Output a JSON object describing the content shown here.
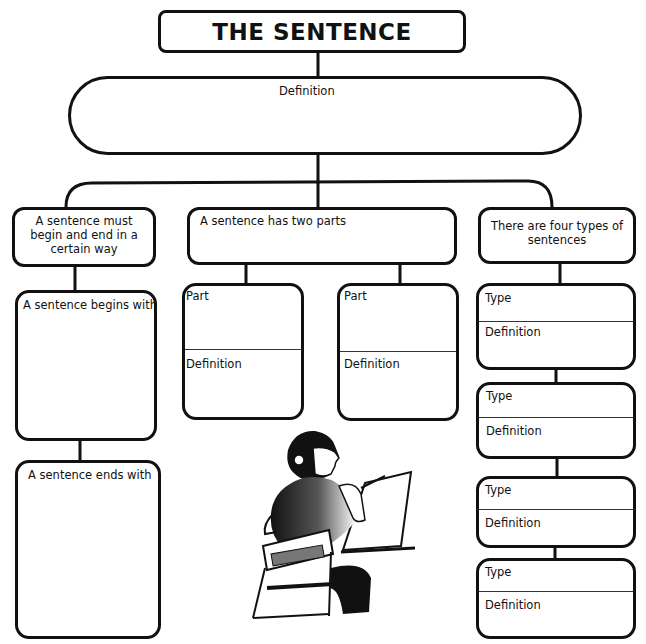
{
  "title": "THE SENTENCE",
  "definition_box": {
    "label": "Definition"
  },
  "branches": {
    "left": {
      "header": "A sentence must begin and end in a certain way",
      "boxes": [
        {
          "label": "A sentence begins with"
        },
        {
          "label": "A sentence ends with"
        }
      ]
    },
    "middle": {
      "header": "A sentence has two parts",
      "parts": [
        {
          "top_label": "Part",
          "bottom_label": "Definition"
        },
        {
          "top_label": "Part",
          "bottom_label": "Definition"
        }
      ]
    },
    "right": {
      "header": "There are four types of sentences",
      "types": [
        {
          "top_label": "Type",
          "bottom_label": "Definition"
        },
        {
          "top_label": "Type",
          "bottom_label": "Definition"
        },
        {
          "top_label": "Type",
          "bottom_label": "Definition"
        },
        {
          "top_label": "Type",
          "bottom_label": "Definition"
        }
      ]
    }
  },
  "illustration": {
    "subject": "boy-writing-at-desk"
  },
  "colors": {
    "ink": "#111111",
    "paper": "#ffffff"
  }
}
